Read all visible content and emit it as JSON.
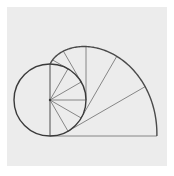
{
  "diagram": {
    "colors": {
      "background": "#ffffff",
      "panel": "#ececec",
      "circle": "#3a3a3a",
      "involute": "#4a4a4a",
      "lines": "#7a7a7a"
    },
    "circle": {
      "cx": 50,
      "cy": 100,
      "r": 36
    },
    "involute": {
      "start_angle_deg": 0,
      "end_angle_deg": 180,
      "direction": "clockwise-from-top"
    },
    "spokes_count": 7,
    "tangent_lines_count": 7
  }
}
